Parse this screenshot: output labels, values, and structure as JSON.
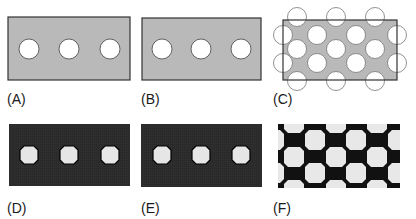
{
  "figure": {
    "panels": [
      {
        "id": "A",
        "label": "(A)",
        "description": "gray plate with three circular holes",
        "fill": "#b8b8b8",
        "stroke": "#333333"
      },
      {
        "id": "B",
        "label": "(B)",
        "description": "gray plate with three circular holes",
        "fill": "#b8b8b8",
        "stroke": "#333333"
      },
      {
        "id": "C",
        "label": "(C)",
        "description": "gray plate with hexagonal array of circular holes extending beyond boundary",
        "fill": "#b8b8b8",
        "stroke": "#333333"
      },
      {
        "id": "D",
        "label": "(D)",
        "description": "pixelated dark mesh with three holes",
        "fill": "#2b2b2b",
        "hole": "#e6e6e6"
      },
      {
        "id": "E",
        "label": "(E)",
        "description": "pixelated dark mesh with three holes",
        "fill": "#2b2b2b",
        "hole": "#e6e6e6"
      },
      {
        "id": "F",
        "label": "(F)",
        "description": "pixelated black mesh with hexagonal array of holes",
        "fill": "#111111",
        "hole": "#e8e8e8"
      }
    ]
  }
}
